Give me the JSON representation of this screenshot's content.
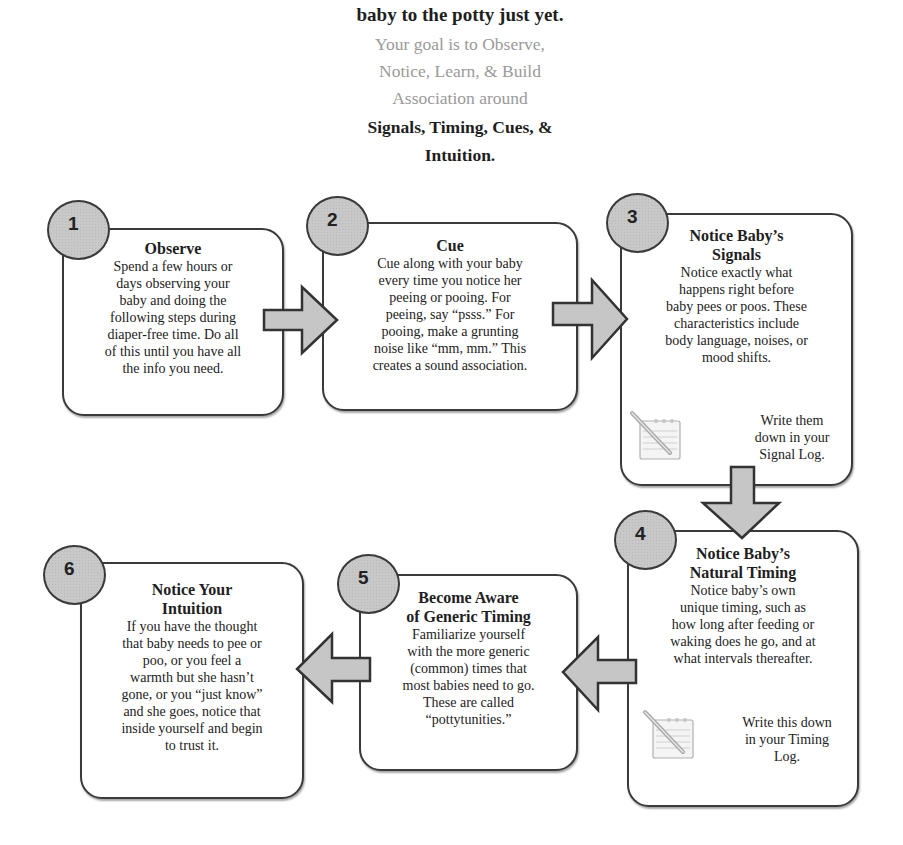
{
  "header": {
    "line1": "Don't rush to take your",
    "line2": "baby to the potty just yet.",
    "goal": "Your goal is to Observe, Notice, Learn, & Build Association around",
    "goal_lines": [
      "Your goal is to Observe,",
      "Notice, Learn, & Build",
      "Association around"
    ],
    "focus_lines": [
      "Signals, Timing, Cues, &",
      "Intuition."
    ]
  },
  "steps": [
    {
      "number": "1",
      "title_lines": [
        "Observe"
      ],
      "body_lines": [
        "Spend a few hours or",
        "days observing your",
        "baby and doing the",
        "following steps during",
        "diaper-free time. Do all",
        "of this until you have all",
        "the info you need."
      ]
    },
    {
      "number": "2",
      "title_lines": [
        "Cue"
      ],
      "body_lines": [
        "Cue along with your baby",
        "every time you notice her",
        "peeing or pooing. For",
        "peeing, say “psss.” For",
        "pooing, make a grunting",
        "noise like “mm, mm.” This",
        "creates a sound association."
      ]
    },
    {
      "number": "3",
      "title_lines": [
        "Notice Baby’s",
        "Signals"
      ],
      "body_lines": [
        "Notice exactly what",
        "happens right before",
        "baby pees or poos. These",
        "characteristics include",
        "body language, noises, or",
        "mood shifts."
      ],
      "note_lines": [
        "Write them",
        "down in your",
        "Signal Log."
      ],
      "note_icon": "notepad-pencil-icon"
    },
    {
      "number": "4",
      "title_lines": [
        "Notice Baby’s",
        "Natural Timing"
      ],
      "body_lines": [
        "Notice baby’s own",
        "unique timing, such as",
        "how long after feeding or",
        "waking does he go, and at",
        "what intervals thereafter."
      ],
      "note_lines": [
        "Write this down",
        "in your Timing",
        "Log."
      ],
      "note_icon": "notepad-pencil-icon"
    },
    {
      "number": "5",
      "title_lines": [
        "Become Aware",
        "of Generic Timing"
      ],
      "body_lines": [
        "Familiarize yourself",
        "with the more generic",
        "(common) times that",
        "most babies need to go.",
        "These are called",
        "“pottytunities.”"
      ]
    },
    {
      "number": "6",
      "title_lines": [
        "Notice Your",
        "Intuition"
      ],
      "body_lines": [
        "If you have the thought",
        "that baby needs to pee or",
        "poo, or you feel a",
        "warmth but she hasn’t",
        "gone, or you “just know”",
        "and she goes, notice that",
        "inside yourself and begin",
        "to trust it."
      ]
    }
  ],
  "colors": {
    "border": "#3a3a3a",
    "fill": "#c8c8c8",
    "goal_text": "#9a9a9a",
    "text": "#1e1e1e"
  }
}
